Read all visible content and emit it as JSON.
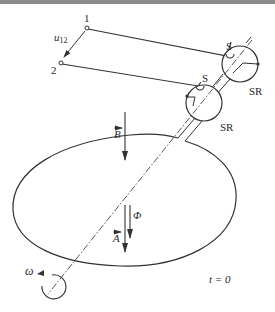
{
  "figure": {
    "labels": {
      "terminal_1": "1",
      "terminal_2": "2",
      "voltage": "u",
      "voltage_sub": "12",
      "brush_upper": "S",
      "brush_lower": "S",
      "ring_upper": "SR",
      "ring_lower": "SR",
      "field_vector": "B",
      "area_vector": "A",
      "flux": "Φ",
      "angular_velocity": "ω",
      "time": "t = 0"
    },
    "colors": {
      "line": "#333333",
      "text": "#2a2a2a",
      "background": "#ffffff",
      "top_border": "#8a8a8a"
    }
  }
}
